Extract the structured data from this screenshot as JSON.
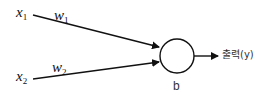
{
  "diagram": {
    "type": "perceptron",
    "inputs": [
      {
        "label": "x",
        "subscript": "1"
      },
      {
        "label": "x",
        "subscript": "2"
      }
    ],
    "weights": [
      {
        "label": "w",
        "subscript": "1"
      },
      {
        "label": "w",
        "subscript": "2"
      }
    ],
    "node": {
      "bias_label": "b"
    },
    "output": {
      "label": "출력(y)"
    },
    "colors": {
      "stroke": "#111111",
      "text": "#333333"
    }
  }
}
